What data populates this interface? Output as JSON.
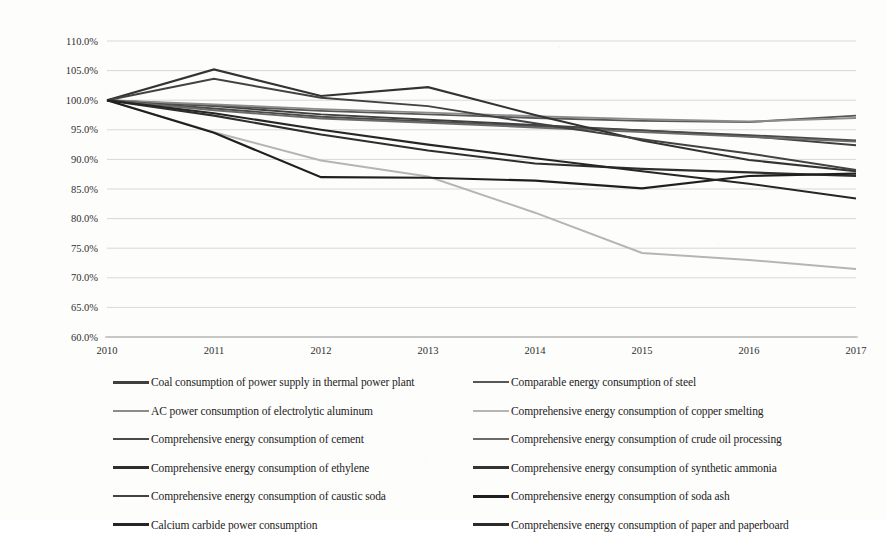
{
  "chart_data": {
    "type": "line",
    "title": "",
    "subtitle": "",
    "xlabel": "",
    "ylabel": "",
    "categories": [
      "2010",
      "2011",
      "2012",
      "2013",
      "2014",
      "2015",
      "2016",
      "2017"
    ],
    "x": [
      2010,
      2011,
      2012,
      2013,
      2014,
      2015,
      2016,
      2017
    ],
    "ylim": [
      60.0,
      110.0
    ],
    "ytick_labels": [
      "110.0%",
      "105.0%",
      "100.0%",
      "95.0%",
      "90.0%",
      "85.0%",
      "80.0%",
      "75.0%",
      "70.0%",
      "65.0%",
      "60.0%"
    ],
    "ytick_values": [
      110.0,
      105.0,
      100.0,
      95.0,
      90.0,
      85.0,
      80.0,
      75.0,
      70.0,
      65.0,
      60.0
    ],
    "ytick_suffix": "%",
    "grid": true,
    "grid_axis": "y",
    "legend_position": "bottom",
    "legend_columns": 2,
    "series": [
      {
        "name": "Coal consumption of power supply in thermal power plant",
        "color": "#3f3f3f",
        "width": 1.9,
        "values": [
          100.0,
          99.0,
          97.6,
          96.7,
          95.8,
          94.9,
          93.9,
          92.4
        ]
      },
      {
        "name": "Comparable energy consumption of steel",
        "color": "#575757",
        "width": 1.9,
        "values": [
          100.0,
          99.1,
          98.2,
          97.6,
          97.0,
          96.5,
          96.3,
          97.4
        ]
      },
      {
        "name": "AC power consumption of electrolytic aluminum",
        "color": "#8c8c8c",
        "width": 1.9,
        "values": [
          100.0,
          99.3,
          98.5,
          97.9,
          97.3,
          96.8,
          96.4,
          97.0
        ]
      },
      {
        "name": "Comprehensive energy consumption of copper smelting",
        "color": "#b5b5b5",
        "width": 2.0,
        "values": [
          100.0,
          94.6,
          89.8,
          87.1,
          81.0,
          74.2,
          73.0,
          71.5
        ]
      },
      {
        "name": "Comprehensive energy consumption of cement",
        "color": "#4a4a4a",
        "width": 1.9,
        "values": [
          100.0,
          98.6,
          97.2,
          96.4,
          95.6,
          94.9,
          94.1,
          93.2
        ]
      },
      {
        "name": "Comprehensive energy consumption of crude oil processing",
        "color": "#6b6b6b",
        "width": 1.9,
        "values": [
          100.0,
          98.3,
          96.9,
          96.2,
          95.4,
          94.6,
          93.8,
          93.0
        ]
      },
      {
        "name": "Comprehensive energy consumption of ethylene",
        "color": "#2e2e2e",
        "width": 2.1,
        "values": [
          100.0,
          97.4,
          94.2,
          91.5,
          89.3,
          88.4,
          87.8,
          87.2
        ]
      },
      {
        "name": "Comprehensive energy consumption of synthetic ammonia",
        "color": "#333333",
        "width": 2.1,
        "values": [
          100.0,
          105.2,
          100.7,
          102.2,
          97.5,
          93.2,
          89.9,
          88.0
        ]
      },
      {
        "name": "Comprehensive energy consumption of caustic soda",
        "color": "#424242",
        "width": 2.0,
        "values": [
          100.0,
          103.6,
          100.4,
          99.0,
          96.1,
          93.4,
          91.0,
          88.2
        ]
      },
      {
        "name": "Comprehensive energy consumption of soda ash",
        "color": "#1f1f1f",
        "width": 2.2,
        "values": [
          100.0,
          94.5,
          87.0,
          86.9,
          86.4,
          85.1,
          87.2,
          87.6
        ]
      },
      {
        "name": "Calcium carbide power consumption",
        "color": "#262626",
        "width": 2.1,
        "values": [
          100.0,
          97.8,
          95.0,
          92.5,
          90.2,
          88.0,
          85.9,
          83.4
        ]
      }
    ]
  },
  "legend": {
    "items": [
      {
        "label": "Coal consumption of power supply in thermal power plant",
        "color": "#3f3f3f",
        "width": 3.0
      },
      {
        "label": "Comparable energy consumption of steel",
        "color": "#575757",
        "width": 2.6
      },
      {
        "label": "AC power consumption of electrolytic aluminum",
        "color": "#8c8c8c",
        "width": 2.4
      },
      {
        "label": "Comprehensive energy consumption of copper smelting",
        "color": "#b5b5b5",
        "width": 2.2
      },
      {
        "label": "Comprehensive energy consumption of cement",
        "color": "#4a4a4a",
        "width": 2.8
      },
      {
        "label": "Comprehensive energy consumption of crude oil processing",
        "color": "#6b6b6b",
        "width": 2.6
      },
      {
        "label": "Comprehensive energy consumption of ethylene",
        "color": "#2e2e2e",
        "width": 3.0
      },
      {
        "label": "Comprehensive energy consumption of synthetic ammonia",
        "color": "#333333",
        "width": 3.0
      },
      {
        "label": "Comprehensive energy consumption of caustic soda",
        "color": "#424242",
        "width": 2.9
      },
      {
        "label": "Comprehensive energy consumption of soda ash",
        "color": "#1f1f1f",
        "width": 3.2
      },
      {
        "label": "Calcium carbide power consumption",
        "color": "#262626",
        "width": 3.0
      },
      {
        "label": "Comprehensive energy consumption of paper and paperboard",
        "color": "#2b2b2b",
        "width": 3.0
      }
    ]
  },
  "colors": {
    "background": "#fdfdfc",
    "gridline": "#c9c9c9",
    "axis": "#9a9a9a",
    "text": "#2f2f2f"
  }
}
